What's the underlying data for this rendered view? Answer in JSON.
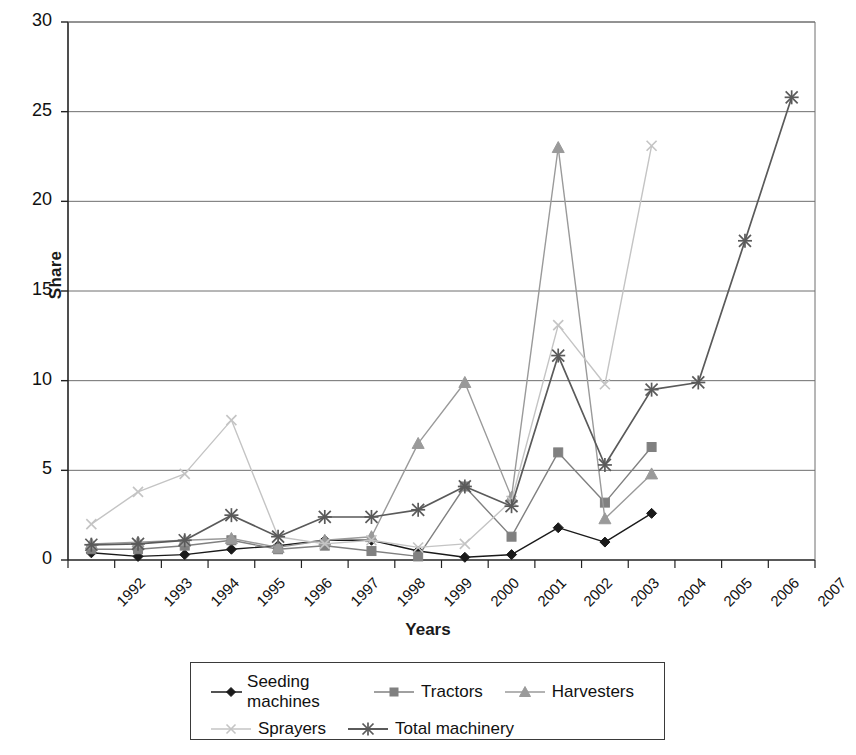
{
  "chart_data": {
    "type": "line",
    "title": "",
    "xlabel": "Years",
    "ylabel": "Share",
    "ylim": [
      0,
      30
    ],
    "yticks": [
      0,
      5,
      10,
      15,
      20,
      25,
      30
    ],
    "grid": "horizontal",
    "legend_position": "bottom",
    "categories": [
      "1992",
      "1993",
      "1994",
      "1995",
      "1996",
      "1997",
      "1998",
      "1999",
      "2000",
      "2001",
      "2002",
      "2003",
      "2004",
      "2005",
      "2006",
      "2007"
    ],
    "series": [
      {
        "name": "Seeding machines",
        "marker": "diamond",
        "color": "#1a1a1a",
        "values": [
          0.4,
          0.2,
          0.3,
          0.6,
          0.8,
          1.1,
          1.1,
          0.5,
          0.15,
          0.3,
          1.8,
          1.0,
          2.6,
          null,
          null,
          null
        ]
      },
      {
        "name": "Tractors",
        "marker": "square",
        "color": "#808080",
        "values": [
          0.6,
          0.6,
          0.8,
          1.1,
          0.6,
          0.8,
          0.5,
          0.2,
          4.1,
          1.3,
          6.0,
          3.2,
          6.3,
          null,
          null,
          null
        ]
      },
      {
        "name": "Harvesters",
        "marker": "triangle",
        "color": "#9a9a9a",
        "values": [
          0.9,
          1.0,
          1.1,
          1.2,
          0.7,
          1.1,
          1.3,
          6.5,
          9.9,
          3.5,
          23.0,
          2.3,
          4.8,
          null,
          null,
          null
        ]
      },
      {
        "name": "Sprayers",
        "marker": "x",
        "color": "#c4c4c4",
        "values": [
          2.0,
          3.8,
          4.8,
          7.8,
          1.3,
          0.9,
          1.1,
          0.7,
          0.9,
          3.3,
          13.1,
          9.8,
          23.1,
          null,
          null,
          null
        ]
      },
      {
        "name": "Total machinery",
        "marker": "asterisk",
        "color": "#5a5a5a",
        "values": [
          0.85,
          0.9,
          1.1,
          2.5,
          1.3,
          2.4,
          2.4,
          2.8,
          4.1,
          3.0,
          11.4,
          5.3,
          9.5,
          9.9,
          17.8,
          25.8
        ]
      }
    ]
  },
  "axes": {
    "y_title": "Share",
    "x_title": "Years",
    "y_tick_labels": [
      "0",
      "5",
      "10",
      "15",
      "20",
      "25",
      "30"
    ],
    "x_tick_labels": [
      "1992",
      "1993",
      "1994",
      "1995",
      "1996",
      "1997",
      "1998",
      "1999",
      "2000",
      "2001",
      "2002",
      "2003",
      "2004",
      "2005",
      "2006",
      "2007"
    ]
  },
  "legend": {
    "row1": [
      {
        "label": "Seeding machines",
        "marker": "diamond",
        "color": "#1a1a1a"
      },
      {
        "label": "Tractors",
        "marker": "square",
        "color": "#808080"
      },
      {
        "label": "Harvesters",
        "marker": "triangle",
        "color": "#9a9a9a"
      }
    ],
    "row2": [
      {
        "label": "Sprayers",
        "marker": "x",
        "color": "#c4c4c4"
      },
      {
        "label": "Total machinery",
        "marker": "asterisk",
        "color": "#5a5a5a"
      }
    ]
  }
}
